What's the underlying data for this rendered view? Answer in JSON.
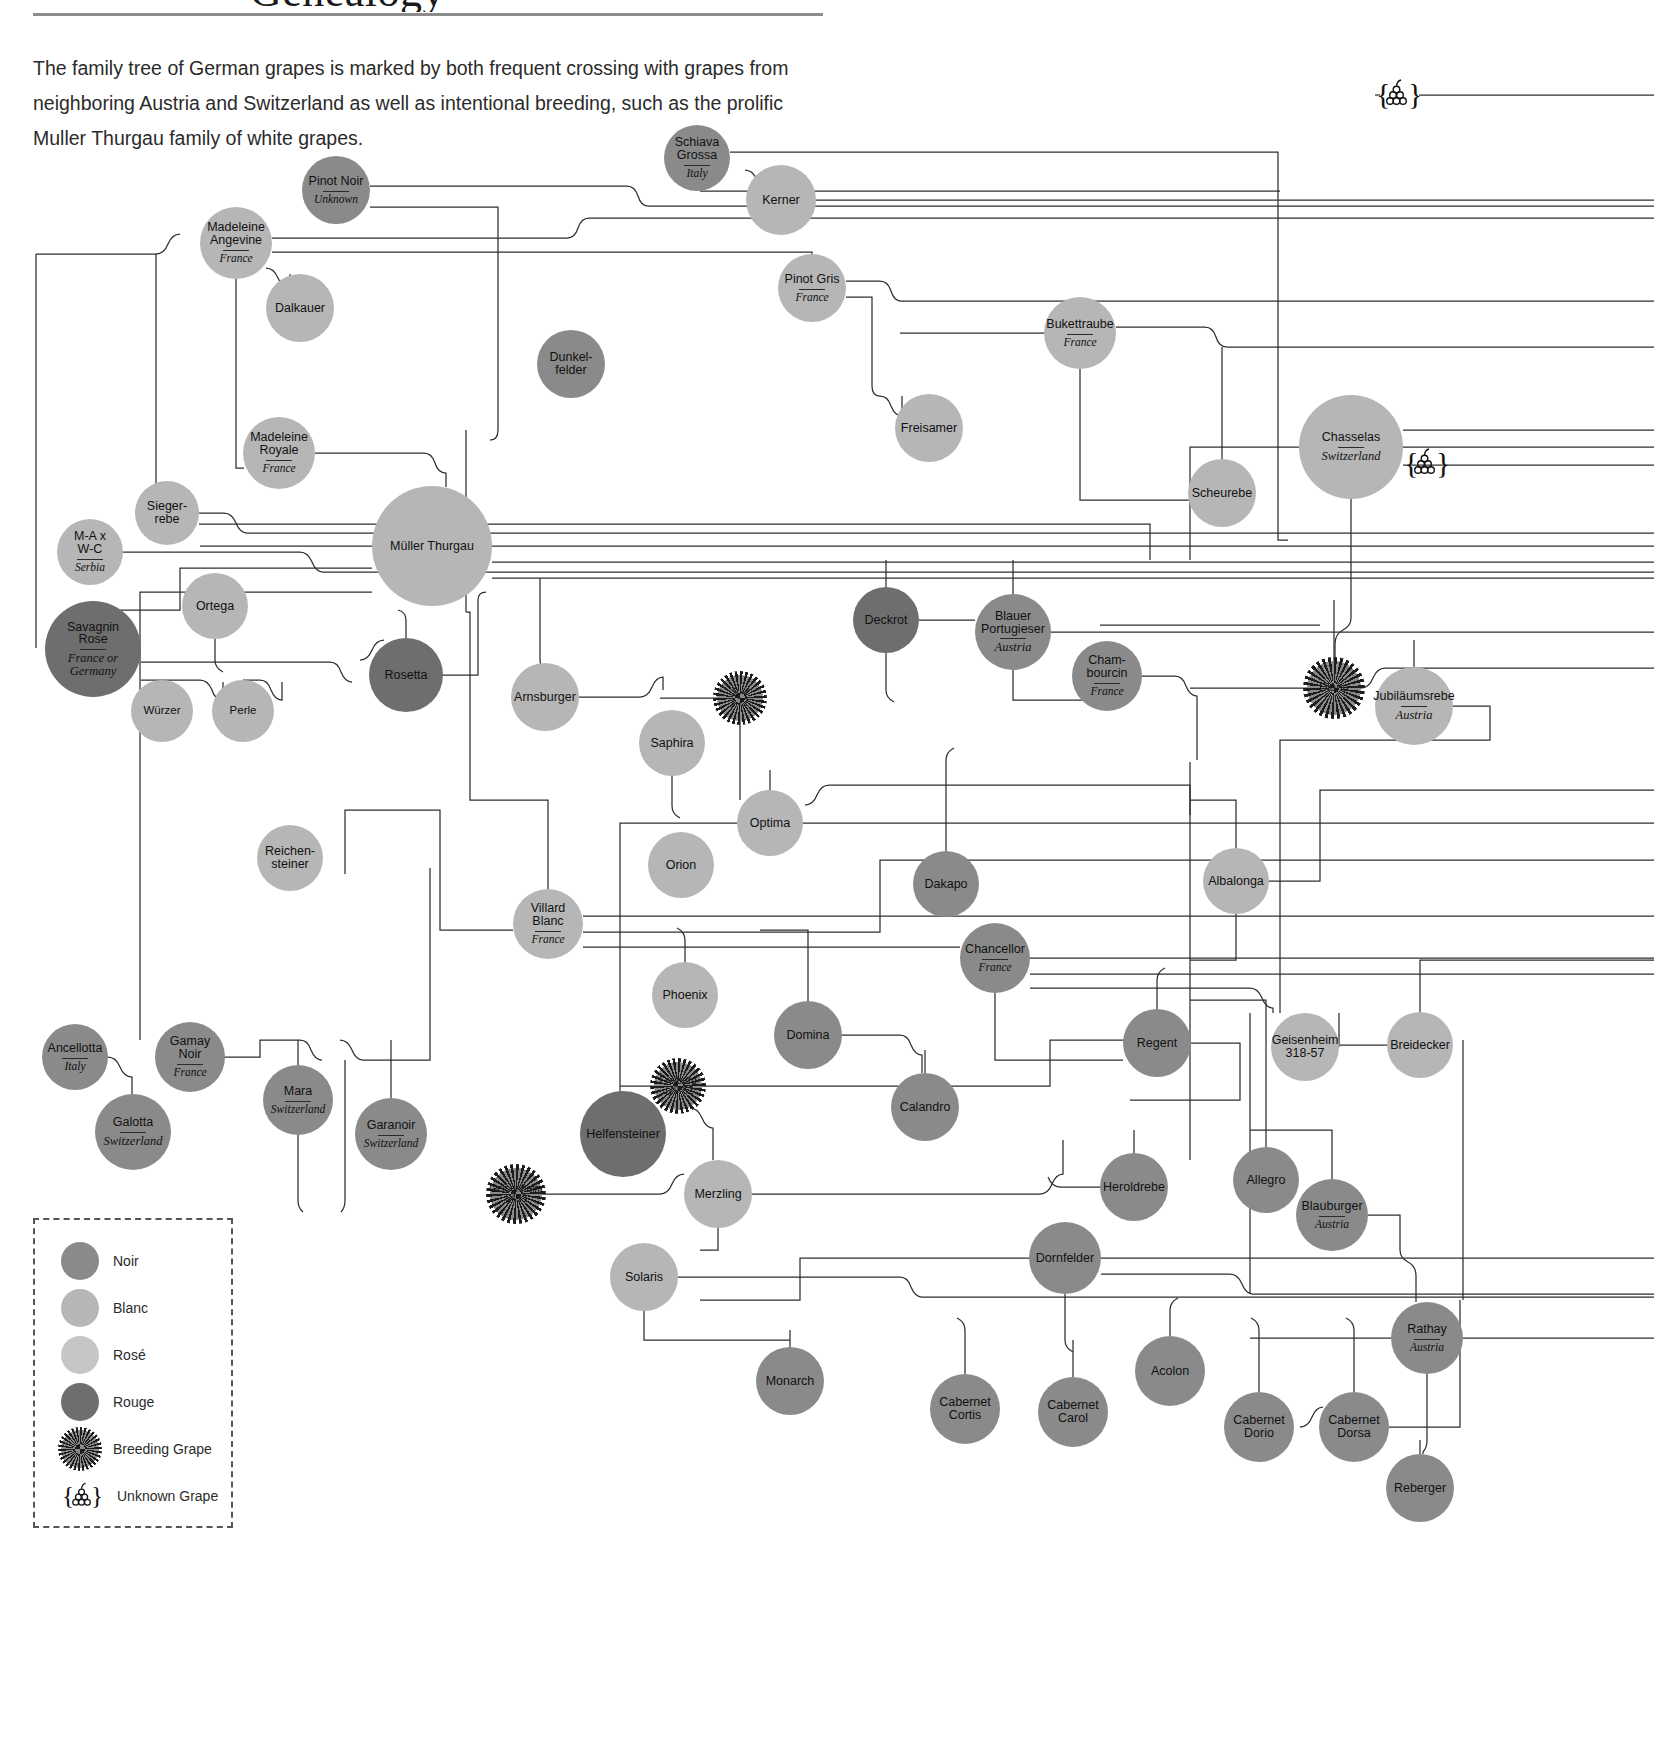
{
  "header": {
    "title_fragment": "Genealogy",
    "intro": "The family tree of German grapes is marked by both frequent crossing with grapes from neighboring Austria and Switzerland as well as intentional breeding, such as the prolific Muller Thurgau family of white grapes."
  },
  "colors": {
    "noir": "#8a8a8a",
    "blanc": "#b6b6b6",
    "rose": "#c6c6c6",
    "rouge": "#6e6e6e",
    "line": "#2f2f2f",
    "text": "#111111"
  },
  "legend": {
    "items": [
      {
        "label": "Noir",
        "kind": "noir"
      },
      {
        "label": "Blanc",
        "kind": "blanc"
      },
      {
        "label": "Rosé",
        "kind": "rose"
      },
      {
        "label": "Rouge",
        "kind": "rouge"
      },
      {
        "label": "Breeding Grape",
        "kind": "breeding"
      },
      {
        "label": "Unknown Grape",
        "kind": "unknown"
      }
    ]
  },
  "chart_data": {
    "type": "diagram",
    "title": "Genealogy",
    "subtype": "family-tree-network",
    "node_count": 62,
    "nodes": [
      {
        "id": "schiava-grossa",
        "name": "Schiava\nGrossa",
        "origin": "Italy",
        "kind": "noir",
        "x": 697,
        "y": 158,
        "r": 33
      },
      {
        "id": "pinot-noir",
        "name": "Pinot Noir",
        "origin": "Unknown",
        "kind": "noir",
        "x": 336,
        "y": 190,
        "r": 34
      },
      {
        "id": "kerner",
        "name": "Kerner",
        "origin": "",
        "kind": "blanc",
        "x": 781,
        "y": 200,
        "r": 35
      },
      {
        "id": "madeleine-angevine",
        "name": "Madeleine\nAngevine",
        "origin": "France",
        "kind": "blanc",
        "x": 236,
        "y": 243,
        "r": 36
      },
      {
        "id": "pinot-gris",
        "name": "Pinot Gris",
        "origin": "France",
        "kind": "blanc",
        "x": 812,
        "y": 288,
        "r": 34
      },
      {
        "id": "dalkauer",
        "name": "Dalkauer",
        "origin": "",
        "kind": "blanc",
        "x": 300,
        "y": 308,
        "r": 34
      },
      {
        "id": "bukettraube",
        "name": "Bukettraube",
        "origin": "France",
        "kind": "blanc",
        "x": 1080,
        "y": 333,
        "r": 36
      },
      {
        "id": "dunkelfelder",
        "name": "Dunkel-\nfelder",
        "origin": "",
        "kind": "noir",
        "x": 571,
        "y": 364,
        "r": 34
      },
      {
        "id": "freisamer",
        "name": "Freisamer",
        "origin": "",
        "kind": "blanc",
        "x": 929,
        "y": 428,
        "r": 34
      },
      {
        "id": "chasselas",
        "name": "Chasselas",
        "origin": "Switzerland",
        "kind": "blanc",
        "x": 1351,
        "y": 447,
        "r": 52
      },
      {
        "id": "madeleine-royale",
        "name": "Madeleine\nRoyale",
        "origin": "France",
        "kind": "blanc",
        "x": 279,
        "y": 453,
        "r": 36
      },
      {
        "id": "scheurebe",
        "name": "Scheurebe",
        "origin": "",
        "kind": "blanc",
        "x": 1222,
        "y": 493,
        "r": 34
      },
      {
        "id": "siegerrebe",
        "name": "Sieger-\nrebe",
        "origin": "",
        "kind": "blanc",
        "x": 167,
        "y": 513,
        "r": 32
      },
      {
        "id": "muller-thurgau",
        "name": "Müller Thurgau",
        "origin": "",
        "kind": "blanc",
        "x": 432,
        "y": 546,
        "r": 60
      },
      {
        "id": "ma-x-wc",
        "name": "M-A x\nW-C",
        "origin": "Serbia",
        "kind": "blanc",
        "x": 90,
        "y": 552,
        "r": 33
      },
      {
        "id": "ortega",
        "name": "Ortega",
        "origin": "",
        "kind": "blanc",
        "x": 215,
        "y": 606,
        "r": 33
      },
      {
        "id": "deckrot",
        "name": "Deckrot",
        "origin": "",
        "kind": "rouge",
        "x": 886,
        "y": 620,
        "r": 33
      },
      {
        "id": "blauer-portugieser",
        "name": "Blauer\nPortugieser",
        "origin": "Austria",
        "kind": "noir",
        "x": 1013,
        "y": 632,
        "r": 38
      },
      {
        "id": "savagnin-rose",
        "name": "Savagnin\nRose",
        "origin": "France or\nGermany",
        "kind": "rouge",
        "x": 93,
        "y": 649,
        "r": 48
      },
      {
        "id": "chambourcin",
        "name": "Cham-\nbourcin",
        "origin": "France",
        "kind": "noir",
        "x": 1107,
        "y": 676,
        "r": 35
      },
      {
        "id": "rosetta",
        "name": "Rosetta",
        "origin": "",
        "kind": "rouge",
        "x": 406,
        "y": 675,
        "r": 37
      },
      {
        "id": "diana",
        "name": "Diana",
        "origin": "",
        "kind": "noir",
        "x": 1334,
        "y": 688,
        "r": 27,
        "breeding": true
      },
      {
        "id": "jubilaumsrebe",
        "name": "Jubiläumsrebe",
        "origin": "Austria",
        "kind": "blanc",
        "x": 1414,
        "y": 706,
        "r": 39
      },
      {
        "id": "arnsburger",
        "name": "Arnsburger",
        "origin": "",
        "kind": "blanc",
        "x": 545,
        "y": 697,
        "r": 34
      },
      {
        "id": "s-v-i-72",
        "name": "S-V\nI-72",
        "origin": "",
        "kind": "noir",
        "x": 740,
        "y": 698,
        "r": 23,
        "breeding": true
      },
      {
        "id": "wurzer",
        "name": "Würzer",
        "origin": "",
        "kind": "blanc",
        "x": 162,
        "y": 711,
        "r": 31
      },
      {
        "id": "perle",
        "name": "Perle",
        "origin": "",
        "kind": "blanc",
        "x": 243,
        "y": 711,
        "r": 31
      },
      {
        "id": "saphira",
        "name": "Saphira",
        "origin": "",
        "kind": "blanc",
        "x": 672,
        "y": 743,
        "r": 33
      },
      {
        "id": "optima",
        "name": "Optima",
        "origin": "",
        "kind": "blanc",
        "x": 770,
        "y": 823,
        "r": 33
      },
      {
        "id": "reichensteiner",
        "name": "Reichen-\nsteiner",
        "origin": "",
        "kind": "blanc",
        "x": 290,
        "y": 858,
        "r": 33
      },
      {
        "id": "orion",
        "name": "Orion",
        "origin": "",
        "kind": "blanc",
        "x": 681,
        "y": 865,
        "r": 33
      },
      {
        "id": "dakapo",
        "name": "Dakapo",
        "origin": "",
        "kind": "noir",
        "x": 946,
        "y": 884,
        "r": 33
      },
      {
        "id": "albalonga",
        "name": "Albalonga",
        "origin": "",
        "kind": "blanc",
        "x": 1236,
        "y": 881,
        "r": 33
      },
      {
        "id": "villard-blanc",
        "name": "Villard\nBlanc",
        "origin": "France",
        "kind": "blanc",
        "x": 548,
        "y": 924,
        "r": 35
      },
      {
        "id": "chancellor",
        "name": "Chancellor",
        "origin": "France",
        "kind": "noir",
        "x": 995,
        "y": 958,
        "r": 35
      },
      {
        "id": "phoenix",
        "name": "Phoenix",
        "origin": "",
        "kind": "blanc",
        "x": 685,
        "y": 995,
        "r": 33
      },
      {
        "id": "regent",
        "name": "Regent",
        "origin": "",
        "kind": "noir",
        "x": 1157,
        "y": 1043,
        "r": 34
      },
      {
        "id": "geisenheim-318-57",
        "name": "Geisenheim\n318-57",
        "origin": "",
        "kind": "blanc",
        "x": 1305,
        "y": 1047,
        "r": 34
      },
      {
        "id": "breidecker",
        "name": "Breidecker",
        "origin": "",
        "kind": "blanc",
        "x": 1420,
        "y": 1045,
        "r": 33
      },
      {
        "id": "domina",
        "name": "Domina",
        "origin": "",
        "kind": "noir",
        "x": 808,
        "y": 1035,
        "r": 34
      },
      {
        "id": "ancellotta",
        "name": "Ancellotta",
        "origin": "Italy",
        "kind": "noir",
        "x": 75,
        "y": 1057,
        "r": 33
      },
      {
        "id": "gamay-noir",
        "name": "Gamay Noir",
        "origin": "France",
        "kind": "noir",
        "x": 190,
        "y": 1057,
        "r": 35
      },
      {
        "id": "freiburg-379-52",
        "name": "Freiburg\n379-52",
        "origin": "",
        "kind": "noir",
        "x": 678,
        "y": 1086,
        "r": 24,
        "breeding": true
      },
      {
        "id": "mara",
        "name": "Mara",
        "origin": "Switzerland",
        "kind": "noir",
        "x": 298,
        "y": 1100,
        "r": 35
      },
      {
        "id": "calandro",
        "name": "Calandro",
        "origin": "",
        "kind": "noir",
        "x": 925,
        "y": 1107,
        "r": 34
      },
      {
        "id": "galotta",
        "name": "Galotta",
        "origin": "Switzerland",
        "kind": "noir",
        "x": 133,
        "y": 1132,
        "r": 38
      },
      {
        "id": "helfensteiner",
        "name": "Helfensteiner",
        "origin": "",
        "kind": "rouge",
        "x": 623,
        "y": 1134,
        "r": 43
      },
      {
        "id": "garanoir",
        "name": "Garanoir",
        "origin": "Switzerland",
        "kind": "noir",
        "x": 391,
        "y": 1134,
        "r": 36
      },
      {
        "id": "heroldrebe",
        "name": "Heroldrebe",
        "origin": "",
        "kind": "noir",
        "x": 1134,
        "y": 1187,
        "r": 34
      },
      {
        "id": "allegro",
        "name": "Allegro",
        "origin": "",
        "kind": "noir",
        "x": 1266,
        "y": 1180,
        "r": 33
      },
      {
        "id": "geisenheim-6493",
        "name": "Geisenheim\n6493",
        "origin": "",
        "kind": "noir",
        "x": 516,
        "y": 1194,
        "r": 26,
        "breeding": true
      },
      {
        "id": "merzling",
        "name": "Merzling",
        "origin": "",
        "kind": "blanc",
        "x": 718,
        "y": 1194,
        "r": 34
      },
      {
        "id": "blauburger",
        "name": "Blauburger",
        "origin": "Austria",
        "kind": "noir",
        "x": 1332,
        "y": 1215,
        "r": 36
      },
      {
        "id": "dornfelder",
        "name": "Dornfelder",
        "origin": "",
        "kind": "noir",
        "x": 1065,
        "y": 1258,
        "r": 36
      },
      {
        "id": "solaris",
        "name": "Solaris",
        "origin": "",
        "kind": "blanc",
        "x": 644,
        "y": 1277,
        "r": 34
      },
      {
        "id": "rathay",
        "name": "Rathay",
        "origin": "Austria",
        "kind": "noir",
        "x": 1427,
        "y": 1338,
        "r": 36
      },
      {
        "id": "acolon",
        "name": "Acolon",
        "origin": "",
        "kind": "noir",
        "x": 1170,
        "y": 1371,
        "r": 35
      },
      {
        "id": "monarch",
        "name": "Monarch",
        "origin": "",
        "kind": "noir",
        "x": 790,
        "y": 1381,
        "r": 34
      },
      {
        "id": "cabernet-cortis",
        "name": "Cabernet\nCortis",
        "origin": "",
        "kind": "noir",
        "x": 965,
        "y": 1409,
        "r": 35
      },
      {
        "id": "cabernet-carol",
        "name": "Cabernet\nCarol",
        "origin": "",
        "kind": "noir",
        "x": 1073,
        "y": 1412,
        "r": 35
      },
      {
        "id": "cabernet-dorio",
        "name": "Cabernet\nDorio",
        "origin": "",
        "kind": "noir",
        "x": 1259,
        "y": 1427,
        "r": 35
      },
      {
        "id": "cabernet-dorsa",
        "name": "Cabernet\nDorsa",
        "origin": "",
        "kind": "noir",
        "x": 1354,
        "y": 1427,
        "r": 35
      },
      {
        "id": "reberger",
        "name": "Reberger",
        "origin": "",
        "kind": "noir",
        "x": 1420,
        "y": 1488,
        "r": 34
      }
    ],
    "unknown_marks": [
      {
        "id": "unknown-top-right",
        "x": 1397,
        "y": 95
      },
      {
        "id": "unknown-chasselas",
        "x": 1425,
        "y": 464
      }
    ]
  }
}
